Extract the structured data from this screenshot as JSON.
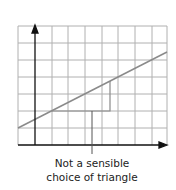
{
  "diagram": {
    "grid": {
      "x0": 18,
      "y0": 26,
      "cols": 9,
      "rows": 7,
      "cell_w": 16.6,
      "cell_h": 17,
      "color": "#b0b0b0"
    },
    "axes": {
      "color": "#111111",
      "origin_x": 35,
      "origin_y": 145,
      "x_end": 166,
      "y_end": 27
    },
    "line": {
      "x1": 18,
      "y1": 128,
      "x2": 167,
      "y2": 52,
      "color": "#8a8a8a"
    },
    "triangle": {
      "left_x": 52,
      "base_y": 111,
      "right_x": 110,
      "top_y": 81,
      "color": "#8a8a8a"
    },
    "pointer": {
      "x": 92,
      "y1": 111,
      "y2": 154,
      "color": "#555555"
    },
    "annotation": {
      "line1": "Not a sensible",
      "line2": "choice of triangle"
    }
  }
}
